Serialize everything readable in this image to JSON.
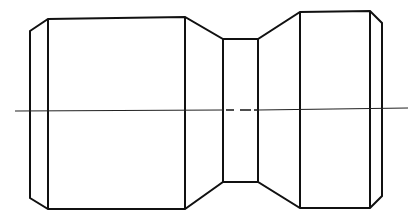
{
  "diagram": {
    "type": "technical-drawing",
    "features": [
      {
        "name": "left-chamfer",
        "kind": "chamfer"
      },
      {
        "name": "left-cylinder",
        "kind": "cylinder"
      },
      {
        "name": "left-taper",
        "kind": "cone"
      },
      {
        "name": "neck",
        "kind": "cylinder"
      },
      {
        "name": "right-taper",
        "kind": "cone"
      },
      {
        "name": "right-cylinder",
        "kind": "cylinder"
      },
      {
        "name": "right-chamfer",
        "kind": "chamfer"
      }
    ],
    "centerline": {
      "style": "dash-dot",
      "label": ""
    },
    "colors": {
      "line": "#111111",
      "background": "#ffffff"
    }
  }
}
